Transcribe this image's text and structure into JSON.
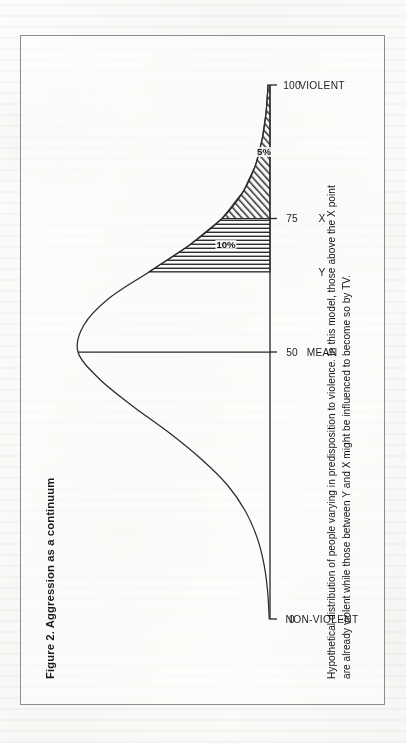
{
  "figure": {
    "title": "Figure 2. Aggression as a continuum",
    "caption_lines": [
      "Hypothetical distribution of people varying in predisposition to violence. In this model, those above the X point",
      "are already violent while those between Y and X might be influenced to become so by TV."
    ]
  },
  "chart_data": {
    "type": "area",
    "title": "Figure 2. Aggression as a continuum",
    "xlabel": "",
    "ylabel": "",
    "xlim": [
      0,
      100
    ],
    "grid": false,
    "legend": null,
    "orientation": "rotated-90-ccw",
    "distribution": "normal bell curve",
    "axis_ticks": [
      {
        "value": 0,
        "number": "0",
        "category": "NON-VIOLENT"
      },
      {
        "value": 50,
        "number": "50",
        "category": "MEAN"
      },
      {
        "value": 75,
        "number": "75",
        "category": "X"
      },
      {
        "value": 100,
        "number": "100",
        "category": "VIOLENT"
      }
    ],
    "point_markers": [
      {
        "label": "Y",
        "value": 65
      },
      {
        "label": "X",
        "value": 75
      }
    ],
    "mean_line": {
      "value": 50,
      "label": "MEAN"
    },
    "shaded_regions": [
      {
        "label": "10%",
        "from": 65,
        "to": 75,
        "hatch": "vertical",
        "description": "between Y and X"
      },
      {
        "label": "5%",
        "from": 75,
        "to": 100,
        "hatch": "diagonal",
        "description": "above X"
      }
    ],
    "curve_points": [
      {
        "x": 0,
        "y": 0.004
      },
      {
        "x": 5,
        "y": 0.012
      },
      {
        "x": 10,
        "y": 0.03
      },
      {
        "x": 15,
        "y": 0.065
      },
      {
        "x": 20,
        "y": 0.125
      },
      {
        "x": 25,
        "y": 0.22
      },
      {
        "x": 30,
        "y": 0.36
      },
      {
        "x": 35,
        "y": 0.53
      },
      {
        "x": 40,
        "y": 0.72
      },
      {
        "x": 45,
        "y": 0.89
      },
      {
        "x": 50,
        "y": 1.0
      },
      {
        "x": 55,
        "y": 0.97
      },
      {
        "x": 60,
        "y": 0.84
      },
      {
        "x": 65,
        "y": 0.63
      },
      {
        "x": 70,
        "y": 0.42
      },
      {
        "x": 75,
        "y": 0.25
      },
      {
        "x": 80,
        "y": 0.14
      },
      {
        "x": 85,
        "y": 0.075
      },
      {
        "x": 90,
        "y": 0.04
      },
      {
        "x": 95,
        "y": 0.02
      },
      {
        "x": 100,
        "y": 0.01
      }
    ],
    "colors": {
      "curve": "#2b2b2b",
      "axis": "#2b2b2b",
      "hatch": "#2e2e2e",
      "text": "#141414"
    }
  }
}
